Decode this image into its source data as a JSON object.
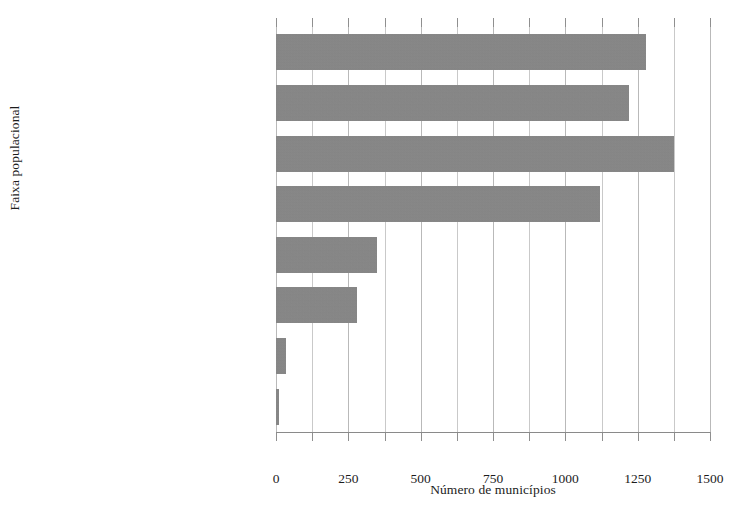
{
  "chart_data": {
    "type": "bar",
    "orientation": "horizontal",
    "title": "",
    "xlabel": "Número de municípios",
    "ylabel": "Faixa populacional",
    "categories": [
      "Até 5.000 hab.",
      "Entre 5.001-10.000 hab.",
      "Entre 10.001-20.000 hab.",
      "Entre 20.001-50.000 hab.",
      "Entre 50.001-100.000 hab.",
      "Entre 100.001-500.000 hab.",
      "Entre 500.001-1.000.000 hab.",
      "Mais de 1.000.000 de hab."
    ],
    "values": [
      1279,
      1219,
      1376,
      1120,
      349,
      280,
      35,
      12
    ],
    "xlim": [
      0,
      1500
    ],
    "xticks": [
      0,
      250,
      500,
      750,
      1000,
      1250,
      1500
    ],
    "xtick_labels": [
      "0",
      "250",
      "500",
      "750",
      "1000",
      "1250",
      "1500"
    ],
    "minor_tick_step": 125,
    "grid": true,
    "grid_axis": "x",
    "legend": null,
    "bar_color": "#878787",
    "gridline_color": "#b9b9b9",
    "text_color": "#1c1c1c"
  }
}
